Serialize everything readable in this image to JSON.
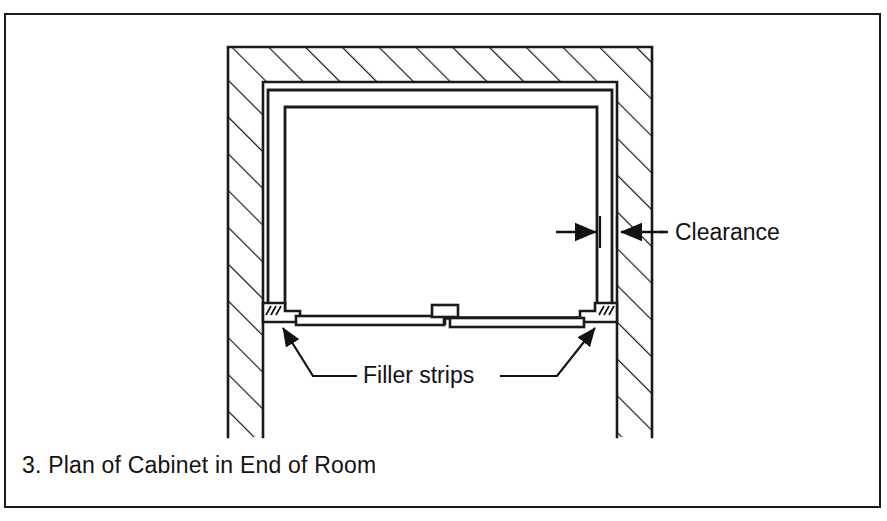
{
  "figure": {
    "caption": "3. Plan of Cabinet in End of Room",
    "number": "3",
    "title": "Plan of Cabinet in End of Room",
    "type": "architectural-plan-drawing",
    "view": "plan"
  },
  "annotations": {
    "clearance": {
      "label": "Clearance",
      "leader": "double-arrow-dimension",
      "points_to": "gap between cabinet side and room wall"
    },
    "filler_strips": {
      "label": "Filler strips",
      "leader": "two-arrow-leaders",
      "points_to": "both front corners of cabinet"
    }
  },
  "elements": {
    "wall_left": "hatched-wall-section",
    "wall_top": "hatched-wall-section",
    "wall_right": "hatched-wall-section",
    "cabinet_box": "cabinet-outline",
    "cabinet_inner": "cabinet-inner-outline",
    "center_detail": "center-stile-detail",
    "filler_strip_left": "filler-strip",
    "filler_strip_right": "filler-strip"
  },
  "colors": {
    "ink": "#121212",
    "line": "#1a1a1a",
    "paper": "#ffffff"
  }
}
